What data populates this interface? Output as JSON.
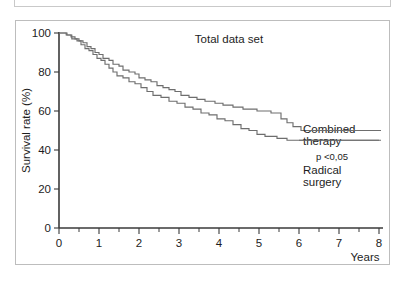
{
  "figure": {
    "title": "Total data set",
    "x_axis_label": "Years",
    "y_axis_label": "Survival rate (%)",
    "x_ticks": [
      "0",
      "1",
      "2",
      "3",
      "4",
      "5",
      "6",
      "7",
      "8"
    ],
    "y_ticks": [
      "0",
      "20",
      "40",
      "60",
      "80",
      "100"
    ],
    "annotations": {
      "combined_line1": "Combined",
      "combined_line2": "therapy",
      "radical_line1": "Radical",
      "radical_line2": "surgery",
      "p_value": "p <0,05"
    },
    "colors": {
      "curve": "#6e6e6e",
      "axis": "#3a3a3a",
      "frame": "#bdbdbd",
      "background": "#ffffff",
      "text": "#1d1d1d"
    }
  },
  "chart_data": {
    "type": "line",
    "subtype": "kaplan-meier-survival",
    "title": "Total data set",
    "xlabel": "Years",
    "ylabel": "Survival rate (%)",
    "xlim": [
      0,
      8
    ],
    "ylim": [
      0,
      100
    ],
    "xticks": [
      0,
      1,
      2,
      3,
      4,
      5,
      6,
      7,
      8
    ],
    "yticks": [
      0,
      20,
      40,
      60,
      80,
      100
    ],
    "minor_xtick_interval": 0.5,
    "grid": false,
    "legend": "inline-annotations-right",
    "p_value": "p <0,05",
    "series": [
      {
        "name": "Combined therapy",
        "label_position": "upper-right",
        "final_survival": 50,
        "points": [
          [
            0.0,
            100
          ],
          [
            0.18,
            100
          ],
          [
            0.18,
            99
          ],
          [
            0.3,
            99
          ],
          [
            0.3,
            98
          ],
          [
            0.4,
            98
          ],
          [
            0.4,
            97
          ],
          [
            0.5,
            97
          ],
          [
            0.5,
            96
          ],
          [
            0.6,
            96
          ],
          [
            0.6,
            95
          ],
          [
            0.7,
            95
          ],
          [
            0.7,
            93
          ],
          [
            0.8,
            93
          ],
          [
            0.8,
            92
          ],
          [
            0.9,
            92
          ],
          [
            0.9,
            90
          ],
          [
            1.0,
            90
          ],
          [
            1.0,
            89
          ],
          [
            1.1,
            89
          ],
          [
            1.1,
            87
          ],
          [
            1.25,
            87
          ],
          [
            1.25,
            86
          ],
          [
            1.35,
            86
          ],
          [
            1.35,
            84
          ],
          [
            1.5,
            84
          ],
          [
            1.5,
            83
          ],
          [
            1.6,
            83
          ],
          [
            1.6,
            81
          ],
          [
            1.75,
            81
          ],
          [
            1.75,
            80
          ],
          [
            1.9,
            80
          ],
          [
            1.9,
            79
          ],
          [
            2.0,
            79
          ],
          [
            2.0,
            77
          ],
          [
            2.15,
            77
          ],
          [
            2.15,
            76
          ],
          [
            2.3,
            76
          ],
          [
            2.3,
            75
          ],
          [
            2.45,
            75
          ],
          [
            2.45,
            73
          ],
          [
            2.6,
            73
          ],
          [
            2.6,
            72
          ],
          [
            2.75,
            72
          ],
          [
            2.75,
            71
          ],
          [
            2.9,
            71
          ],
          [
            2.9,
            70
          ],
          [
            3.05,
            70
          ],
          [
            3.05,
            68
          ],
          [
            3.25,
            68
          ],
          [
            3.25,
            67
          ],
          [
            3.45,
            67
          ],
          [
            3.45,
            66
          ],
          [
            3.65,
            66
          ],
          [
            3.65,
            65
          ],
          [
            3.9,
            65
          ],
          [
            3.9,
            64
          ],
          [
            4.1,
            64
          ],
          [
            4.1,
            63
          ],
          [
            4.35,
            63
          ],
          [
            4.35,
            62
          ],
          [
            4.6,
            62
          ],
          [
            4.6,
            61
          ],
          [
            4.95,
            61
          ],
          [
            4.95,
            60
          ],
          [
            5.3,
            60
          ],
          [
            5.3,
            59
          ],
          [
            5.55,
            59
          ],
          [
            5.55,
            56
          ],
          [
            5.7,
            56
          ],
          [
            5.7,
            54
          ],
          [
            5.85,
            54
          ],
          [
            5.85,
            52
          ],
          [
            6.05,
            52
          ],
          [
            6.05,
            50
          ],
          [
            6.2,
            50
          ],
          [
            8.0,
            50
          ]
        ]
      },
      {
        "name": "Radical surgery",
        "label_position": "lower-right",
        "final_survival": 45,
        "points": [
          [
            0.0,
            100
          ],
          [
            0.2,
            100
          ],
          [
            0.2,
            99
          ],
          [
            0.32,
            99
          ],
          [
            0.32,
            97
          ],
          [
            0.45,
            97
          ],
          [
            0.45,
            96
          ],
          [
            0.55,
            96
          ],
          [
            0.55,
            94
          ],
          [
            0.65,
            94
          ],
          [
            0.65,
            92
          ],
          [
            0.75,
            92
          ],
          [
            0.75,
            91
          ],
          [
            0.85,
            91
          ],
          [
            0.85,
            89
          ],
          [
            0.95,
            89
          ],
          [
            0.95,
            87
          ],
          [
            1.05,
            87
          ],
          [
            1.05,
            86
          ],
          [
            1.15,
            86
          ],
          [
            1.15,
            84
          ],
          [
            1.25,
            84
          ],
          [
            1.25,
            82
          ],
          [
            1.35,
            82
          ],
          [
            1.35,
            80
          ],
          [
            1.45,
            80
          ],
          [
            1.45,
            78
          ],
          [
            1.6,
            78
          ],
          [
            1.6,
            77
          ],
          [
            1.75,
            77
          ],
          [
            1.75,
            75
          ],
          [
            1.9,
            75
          ],
          [
            1.9,
            74
          ],
          [
            2.05,
            74
          ],
          [
            2.05,
            72
          ],
          [
            2.2,
            72
          ],
          [
            2.2,
            70
          ],
          [
            2.35,
            70
          ],
          [
            2.35,
            68
          ],
          [
            2.55,
            68
          ],
          [
            2.55,
            67
          ],
          [
            2.75,
            67
          ],
          [
            2.75,
            65
          ],
          [
            2.95,
            65
          ],
          [
            2.95,
            64
          ],
          [
            3.15,
            64
          ],
          [
            3.15,
            62
          ],
          [
            3.35,
            62
          ],
          [
            3.35,
            61
          ],
          [
            3.55,
            61
          ],
          [
            3.55,
            59
          ],
          [
            3.75,
            59
          ],
          [
            3.75,
            58
          ],
          [
            3.95,
            58
          ],
          [
            3.95,
            56
          ],
          [
            4.15,
            56
          ],
          [
            4.15,
            55
          ],
          [
            4.35,
            55
          ],
          [
            4.35,
            53
          ],
          [
            4.55,
            53
          ],
          [
            4.55,
            51
          ],
          [
            4.75,
            51
          ],
          [
            4.75,
            50
          ],
          [
            4.95,
            50
          ],
          [
            4.95,
            48
          ],
          [
            5.15,
            48
          ],
          [
            5.15,
            47
          ],
          [
            5.45,
            47
          ],
          [
            5.45,
            46
          ],
          [
            5.7,
            46
          ],
          [
            5.7,
            45
          ],
          [
            6.0,
            45
          ],
          [
            8.0,
            45
          ]
        ]
      }
    ]
  }
}
